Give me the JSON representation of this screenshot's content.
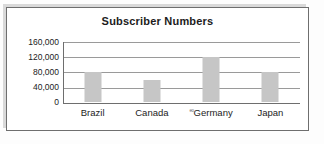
{
  "chart_data": {
    "type": "bar",
    "title": "Subscriber Numbers",
    "xlabel": "",
    "ylabel": "",
    "categories": [
      "Brazil",
      "Canada",
      "Germany",
      "Japan"
    ],
    "values": [
      80000,
      57000,
      117000,
      79000
    ],
    "ylim": [
      0,
      160000
    ],
    "yticks": [
      0,
      40000,
      80000,
      120000,
      160000
    ],
    "ytick_labels": [
      "0",
      "40,000",
      "80,000",
      "120,000",
      "160,000"
    ],
    "grid": true,
    "legend": null,
    "legend_position": "none",
    "bar_color": "#c6c6c6",
    "gridline_color": "#9a9a9a",
    "axis_color": "#6e6e6e",
    "text_color": "#1c1c1c"
  },
  "annotations": {
    "germany_scan_artifact": "eo"
  },
  "frame": {
    "border_color": "#6e6e6e",
    "background": "#ffffff"
  }
}
